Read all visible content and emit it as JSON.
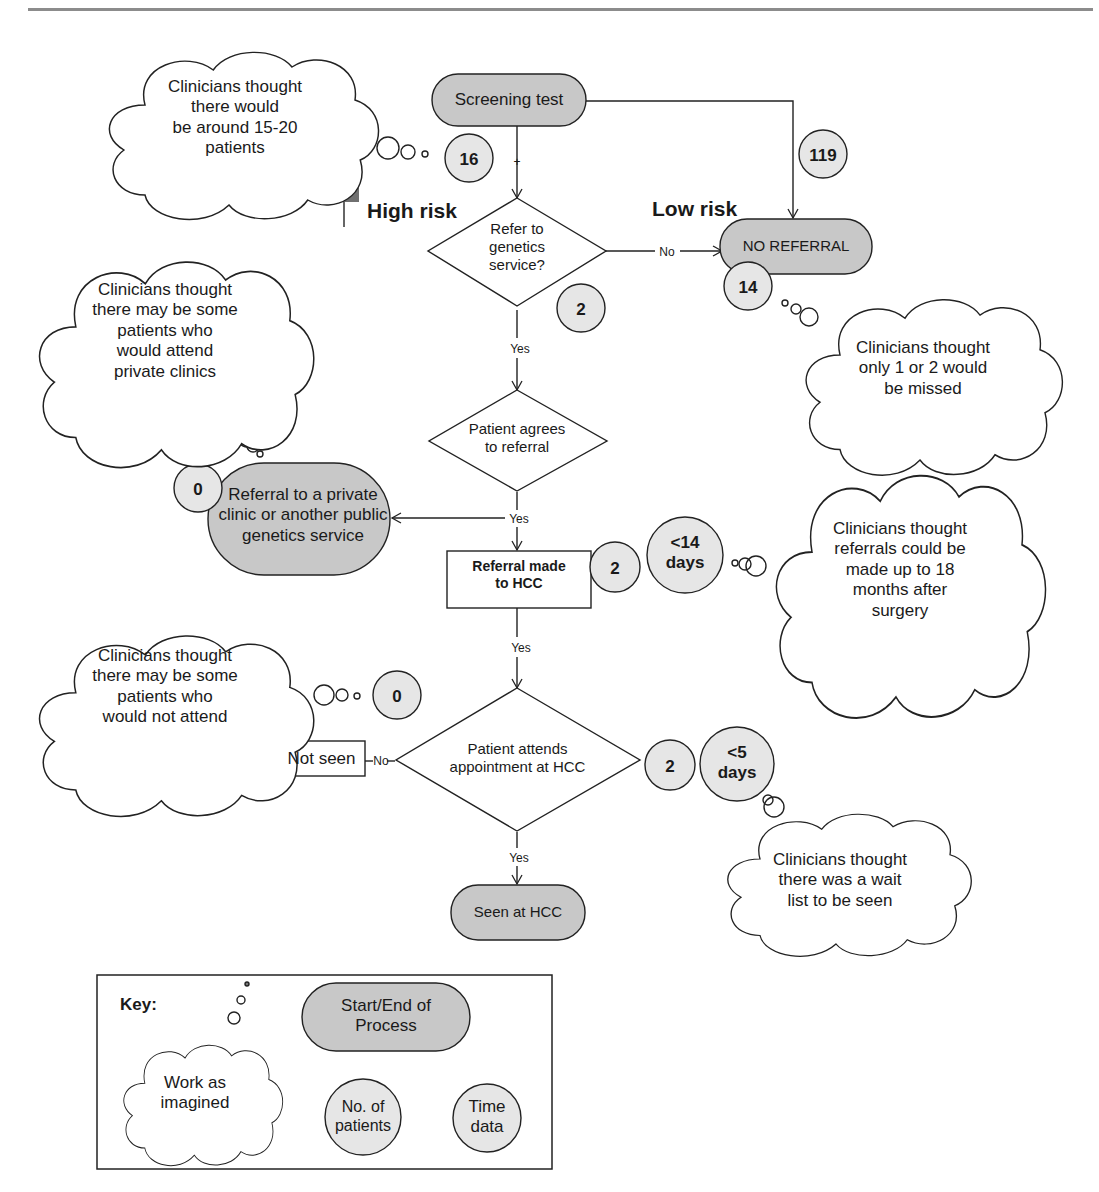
{
  "diagram": {
    "type": "process-flowchart",
    "colors": {
      "terminal_fill": "#c8c8c8",
      "badge_fill": "#e6e6e6",
      "stroke": "#222222",
      "flag": "#707070"
    },
    "risk_labels": {
      "high": "High risk",
      "low": "Low risk"
    },
    "nodes": {
      "screening_test": "Screening test",
      "refer_decision": "Refer to\ngenetics\nservice?",
      "no_referral": "NO REFERRAL",
      "patient_agrees": "Patient agrees\nto referral",
      "private_referral": "Referral to a private\nclinic or another public\ngenetics service",
      "referral_made": "Referral made\nto HCC",
      "patient_attends": "Patient attends\nappointment at HCC",
      "not_seen": "Not seen",
      "seen_at_hcc": "Seen at HCC"
    },
    "edge_labels": {
      "screen_plus": "+",
      "refer_no": "No",
      "refer_yes": "Yes",
      "agrees_yes": "Yes",
      "made_yes": "Yes",
      "attends_no": "No",
      "attends_yes": "Yes"
    },
    "patient_counts": {
      "high_risk": "16",
      "low_risk": "119",
      "refer_decision": "2",
      "no_referral": "14",
      "private_referral": "0",
      "referral_made": "2",
      "not_attend": "0",
      "attends": "2"
    },
    "time_data": {
      "referral_made": "<14\ndays",
      "attends": "<5\ndays"
    },
    "clouds": {
      "screening": "Clinicians thought\nthere would\nbe around 15-20\npatients",
      "private": "Clinicians thought\nthere may be some\npatients who\nwould attend\nprivate clinics",
      "missed": "Clinicians thought\nonly 1 or 2 would\nbe missed",
      "referral_time": "Clinicians thought\nreferrals could be\nmade up to 18\nmonths after\nsurgery",
      "not_attend": "Clinicians thought\nthere may be some\npatients who\nwould not attend",
      "wait_list": "Clinicians thought\nthere was a wait\nlist to be seen"
    },
    "key": {
      "title": "Key:",
      "cloud": "Work as\nimagined",
      "terminal": "Start/End of\nProcess",
      "patients": "No. of\npatients",
      "time": "Time\ndata"
    }
  }
}
